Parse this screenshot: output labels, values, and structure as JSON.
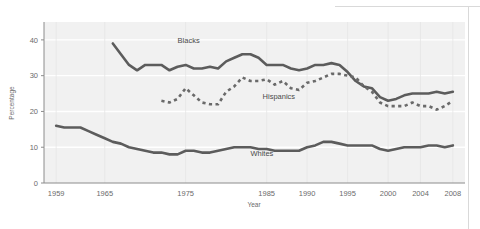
{
  "chart_data": {
    "type": "line",
    "title": "",
    "xlabel": "Year",
    "ylabel": "Percentage",
    "xlim": [
      1957.5,
      2009.5
    ],
    "ylim": [
      0,
      45
    ],
    "xticks": [
      "1959",
      "1965",
      "1975",
      "1985",
      "1990",
      "1995",
      "2000",
      "2004",
      "2008"
    ],
    "xtick_values": [
      1959,
      1965,
      1975,
      1985,
      1990,
      1995,
      2000,
      2004,
      2008
    ],
    "yticks": [
      "0",
      "10",
      "20",
      "30",
      "40"
    ],
    "ytick_values": [
      0,
      10,
      20,
      30,
      40
    ],
    "grid": "horizontal-white-on-gray",
    "legend": "inline-labels",
    "plot_bgcolor": "#f1f1f1",
    "gridline_color": "#ffffff",
    "series": [
      {
        "name": "Blacks",
        "label": "Blacks",
        "style": "solid",
        "color": "#5c5c5c",
        "label_x": 1974.0,
        "label_y": 39.0,
        "x": [
          1966,
          1967,
          1968,
          1969,
          1970,
          1971,
          1972,
          1973,
          1974,
          1975,
          1976,
          1977,
          1978,
          1979,
          1980,
          1981,
          1982,
          1983,
          1984,
          1985,
          1986,
          1987,
          1988,
          1989,
          1990,
          1991,
          1992,
          1993,
          1994,
          1995,
          1996,
          1997,
          1998,
          1999,
          2000,
          2001,
          2002,
          2003,
          2004,
          2005,
          2006,
          2007,
          2008
        ],
        "values": [
          39.0,
          36.0,
          33.0,
          31.5,
          33.0,
          33.0,
          33.0,
          31.5,
          32.5,
          33.0,
          32.0,
          32.0,
          32.5,
          32.0,
          34.0,
          35.0,
          36.0,
          36.0,
          35.0,
          33.0,
          33.0,
          33.0,
          32.0,
          31.5,
          32.0,
          33.0,
          33.0,
          33.5,
          33.0,
          31.0,
          28.5,
          27.0,
          26.5,
          24.0,
          23.0,
          23.5,
          24.5,
          25.0,
          25.0,
          25.0,
          25.5,
          25.0,
          25.5
        ]
      },
      {
        "name": "Hispanics",
        "label": "Hispanics",
        "style": "dashed",
        "color": "#6a6a6a",
        "label_x": 1984.5,
        "label_y": 23.5,
        "x": [
          1972,
          1973,
          1974,
          1975,
          1976,
          1977,
          1978,
          1979,
          1980,
          1981,
          1982,
          1983,
          1984,
          1985,
          1986,
          1987,
          1988,
          1989,
          1990,
          1991,
          1992,
          1993,
          1994,
          1995,
          1996,
          1997,
          1998,
          1999,
          2000,
          2001,
          2002,
          2003,
          2004,
          2005,
          2006,
          2007,
          2008
        ],
        "values": [
          23.0,
          22.5,
          23.5,
          26.5,
          24.5,
          22.5,
          22.0,
          22.0,
          25.5,
          27.0,
          29.5,
          28.5,
          28.5,
          29.0,
          27.5,
          28.5,
          26.5,
          26.0,
          28.0,
          28.5,
          29.5,
          30.5,
          30.5,
          30.0,
          29.5,
          27.0,
          25.5,
          22.5,
          21.5,
          21.5,
          21.5,
          22.5,
          21.5,
          21.5,
          20.5,
          21.5,
          23.0
        ]
      },
      {
        "name": "Whites",
        "label": "Whites",
        "style": "solid",
        "color": "#5c5c5c",
        "label_x": 1983.0,
        "label_y": 7.5,
        "x": [
          1959,
          1960,
          1961,
          1962,
          1963,
          1964,
          1965,
          1966,
          1967,
          1968,
          1969,
          1970,
          1971,
          1972,
          1973,
          1974,
          1975,
          1976,
          1977,
          1978,
          1979,
          1980,
          1981,
          1982,
          1983,
          1984,
          1985,
          1986,
          1987,
          1988,
          1989,
          1990,
          1991,
          1992,
          1993,
          1994,
          1995,
          1996,
          1997,
          1998,
          1999,
          2000,
          2001,
          2002,
          2003,
          2004,
          2005,
          2006,
          2007,
          2008
        ],
        "values": [
          16.0,
          15.5,
          15.5,
          15.5,
          14.5,
          13.5,
          12.5,
          11.5,
          11.0,
          10.0,
          9.5,
          9.0,
          8.5,
          8.5,
          8.0,
          8.0,
          9.0,
          9.0,
          8.5,
          8.5,
          9.0,
          9.5,
          10.0,
          10.0,
          10.0,
          9.5,
          9.5,
          9.0,
          9.0,
          9.0,
          9.0,
          10.0,
          10.5,
          11.5,
          11.5,
          11.0,
          10.5,
          10.5,
          10.5,
          10.5,
          9.5,
          9.0,
          9.5,
          10.0,
          10.0,
          10.0,
          10.5,
          10.5,
          10.0,
          10.5
        ]
      }
    ]
  }
}
